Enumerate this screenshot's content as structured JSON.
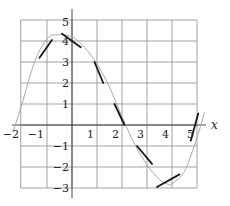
{
  "chart_data": {
    "type": "line",
    "title": "",
    "xlabel": "x",
    "ylabel": "",
    "xlim": [
      -2.4,
      5.4
    ],
    "ylim": [
      -3.5,
      5.5
    ],
    "grid": true,
    "grid_x": [
      -2,
      -1,
      0,
      1,
      2,
      3,
      4,
      5
    ],
    "grid_y": [
      -3,
      -2,
      -1,
      0,
      1,
      2,
      3,
      4,
      5
    ],
    "x_ticks": [
      {
        "value": -2,
        "label": "−2"
      },
      {
        "value": -1,
        "label": "−1"
      },
      {
        "value": 1,
        "label": "1"
      },
      {
        "value": 2,
        "label": "2"
      },
      {
        "value": 3,
        "label": "3"
      },
      {
        "value": 4,
        "label": "4"
      },
      {
        "value": 5,
        "label": "5"
      }
    ],
    "y_ticks": [
      {
        "value": 5,
        "label": "5"
      },
      {
        "value": 4,
        "label": "4"
      },
      {
        "value": 3,
        "label": "3"
      },
      {
        "value": 2,
        "label": "2"
      },
      {
        "value": 1,
        "label": "1"
      },
      {
        "value": -1,
        "label": "−1"
      },
      {
        "value": -2,
        "label": "−2"
      },
      {
        "value": -3,
        "label": "−3"
      }
    ],
    "series": [
      {
        "name": "curve",
        "style": "thin gray",
        "x": [
          -2.35,
          -2.0,
          -1.5,
          -1.0,
          -0.6,
          0.0,
          0.5,
          1.0,
          1.5,
          2.0,
          2.5,
          3.0,
          3.5,
          3.8,
          4.0,
          4.5,
          5.0,
          5.3
        ],
        "y": [
          -0.3,
          1.0,
          3.0,
          4.1,
          4.3,
          4.2,
          3.7,
          2.9,
          1.8,
          0.4,
          -0.9,
          -1.9,
          -2.6,
          -2.8,
          -2.8,
          -2.2,
          -0.6,
          0.6
        ]
      }
    ],
    "tangent_segments": [
      {
        "x1": -1.3,
        "y1": 3.2,
        "x2": -0.8,
        "y2": 4.05
      },
      {
        "x1": -0.4,
        "y1": 4.35,
        "x2": 0.35,
        "y2": 3.7
      },
      {
        "x1": 0.9,
        "y1": 3.0,
        "x2": 1.25,
        "y2": 2.0
      },
      {
        "x1": 1.7,
        "y1": 1.0,
        "x2": 2.1,
        "y2": 0.0
      },
      {
        "x1": 2.6,
        "y1": -1.0,
        "x2": 3.2,
        "y2": -1.85
      },
      {
        "x1": 3.4,
        "y1": -2.95,
        "x2": 4.3,
        "y2": -2.35
      },
      {
        "x1": 4.75,
        "y1": -0.75,
        "x2": 5.05,
        "y2": 0.55
      }
    ]
  },
  "labels": {
    "x_axis": "x"
  }
}
